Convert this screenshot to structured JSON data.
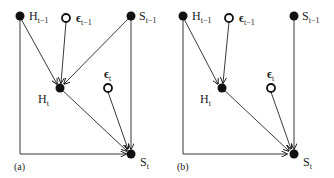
{
  "panels": [
    {
      "id": "a",
      "label": "(a)",
      "nodes": {
        "h_prev": {
          "base": "H",
          "sub": "t−1",
          "type": "filled"
        },
        "eps_prev": {
          "base": "ϵ",
          "sub": "t−1",
          "type": "open"
        },
        "s_prev": {
          "base": "S",
          "sub": "t−1",
          "type": "filled"
        },
        "h_t": {
          "base": "H",
          "sub": "t",
          "type": "filled"
        },
        "eps_t": {
          "base": "ϵ",
          "sub": "t",
          "type": "open"
        },
        "s_t": {
          "base": "S",
          "sub": "t",
          "type": "filled"
        }
      },
      "edges": [
        [
          "H_t-1",
          "H_t"
        ],
        [
          "eps_t-1",
          "H_t"
        ],
        [
          "S_t-1",
          "H_t"
        ],
        [
          "H_t-1",
          "S_t"
        ],
        [
          "S_t-1",
          "S_t"
        ],
        [
          "H_t",
          "S_t"
        ],
        [
          "eps_t",
          "S_t"
        ]
      ]
    },
    {
      "id": "b",
      "label": "(b)",
      "nodes": {
        "h_prev": {
          "base": "H",
          "sub": "t−1",
          "type": "filled"
        },
        "eps_prev": {
          "base": "ϵ",
          "sub": "t−1",
          "type": "open"
        },
        "s_prev": {
          "base": "S",
          "sub": "t−1",
          "type": "filled"
        },
        "h_t": {
          "base": "H",
          "sub": "t",
          "type": "filled"
        },
        "eps_t": {
          "base": "ϵ",
          "sub": "t",
          "type": "open"
        },
        "s_t": {
          "base": "S",
          "sub": "t",
          "type": "filled"
        }
      },
      "edges": [
        [
          "H_t-1",
          "H_t"
        ],
        [
          "eps_t-1",
          "H_t"
        ],
        [
          "H_t-1",
          "S_t"
        ],
        [
          "S_t-1",
          "S_t"
        ],
        [
          "H_t",
          "S_t"
        ],
        [
          "eps_t",
          "S_t"
        ]
      ]
    }
  ]
}
